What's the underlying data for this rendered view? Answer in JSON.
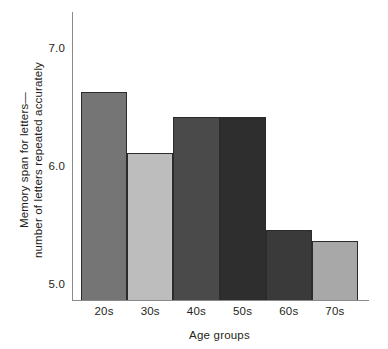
{
  "chart_data": {
    "type": "bar",
    "title": "",
    "xlabel": "Age groups",
    "ylabel": "Memory span for letters—\nnumber of letters repeated accurately",
    "categories": [
      "20s",
      "30s",
      "40s",
      "50s",
      "60s",
      "70s"
    ],
    "values": [
      6.72,
      6.18,
      6.5,
      6.5,
      5.49,
      5.39
    ],
    "yticks": [
      "5.0",
      "6.0",
      "7.0"
    ],
    "ytick_values": [
      5.0,
      6.0,
      7.0
    ],
    "ylim": [
      4.86,
      7.44
    ],
    "grid": false,
    "legend": null,
    "bar_colors": [
      "#757575",
      "#bdbdbd",
      "#4a4a4a",
      "#2e2e2e",
      "#3a3a3a",
      "#a8a8a8"
    ],
    "bar_edge_color": "#2b2b2b",
    "axis_color": "#8a8a8a",
    "text_color": "#231f20",
    "background": "#ffffff"
  }
}
